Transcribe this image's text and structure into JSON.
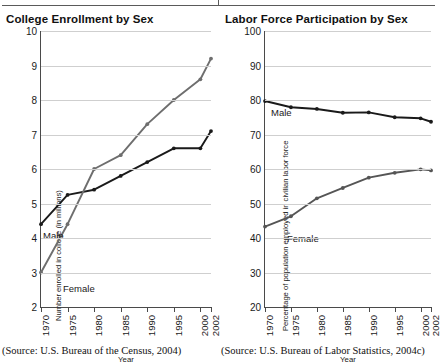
{
  "figure": {
    "divider_icon": "vertical-tick-divider"
  },
  "panels": [
    {
      "key": "college_enrollment",
      "title": "College Enrollment by Sex",
      "source": "(Source: U.S. Bureau of the Census, 2004)",
      "male_label": "Male",
      "female_label": "Female"
    },
    {
      "key": "labor_force",
      "title": "Labor Force Participation by Sex",
      "source": "(Source: U.S. Bureau of Labor Statistics, 2004c)",
      "male_label": "Male",
      "female_label": "Female"
    }
  ],
  "chart_data": [
    {
      "type": "line",
      "key": "college_enrollment",
      "title": "College Enrollment by Sex",
      "xlabel": "Year",
      "ylabel": "Number enrolled in college (in millions)",
      "categories": [
        "1970",
        "1975",
        "1980",
        "1985",
        "1990",
        "1995",
        "2000",
        "2002"
      ],
      "x": [
        1970,
        1975,
        1980,
        1985,
        1990,
        1995,
        2000,
        2002
      ],
      "xlim": [
        1970,
        2002
      ],
      "ylim": [
        2,
        10
      ],
      "yticks": [
        2,
        3,
        4,
        5,
        6,
        7,
        8,
        9,
        10
      ],
      "xticklabels": [
        "1970",
        "1975",
        "1980",
        "1985",
        "1990",
        "1995",
        "2000",
        "2002"
      ],
      "grid": true,
      "legend": "inline-labels",
      "series": [
        {
          "name": "Male",
          "color": "#1a1a1a",
          "values": [
            4.4,
            5.25,
            5.4,
            5.8,
            6.2,
            6.6,
            6.6,
            7.1
          ]
        },
        {
          "name": "Female",
          "color": "#6e6e6e",
          "values": [
            3.0,
            4.4,
            6.0,
            6.4,
            7.3,
            8.0,
            8.6,
            9.2
          ]
        }
      ]
    },
    {
      "type": "line",
      "key": "labor_force",
      "title": "Labor Force Participation by Sex",
      "xlabel": "Year",
      "ylabel": "Percentage of population employed in civilian labor force",
      "categories": [
        "1970",
        "1975",
        "1980",
        "1985",
        "1990",
        "1995",
        "2000",
        "2002"
      ],
      "x": [
        1970,
        1975,
        1980,
        1985,
        1990,
        1995,
        2000,
        2002
      ],
      "xlim": [
        1970,
        2002
      ],
      "ylim": [
        20,
        100
      ],
      "yticks": [
        20,
        30,
        40,
        50,
        60,
        70,
        80,
        90,
        100
      ],
      "xticklabels": [
        "1970",
        "1975",
        "1980",
        "1985",
        "1990",
        "1995",
        "2000",
        "2002"
      ],
      "grid": true,
      "legend": "inline-labels",
      "series": [
        {
          "name": "Male",
          "color": "#1a1a1a",
          "values": [
            79.7,
            77.9,
            77.4,
            76.3,
            76.4,
            75.0,
            74.7,
            73.7
          ]
        },
        {
          "name": "Female",
          "color": "#555555",
          "values": [
            43.3,
            46.3,
            51.5,
            54.5,
            57.5,
            58.9,
            59.9,
            59.6
          ]
        }
      ]
    }
  ]
}
